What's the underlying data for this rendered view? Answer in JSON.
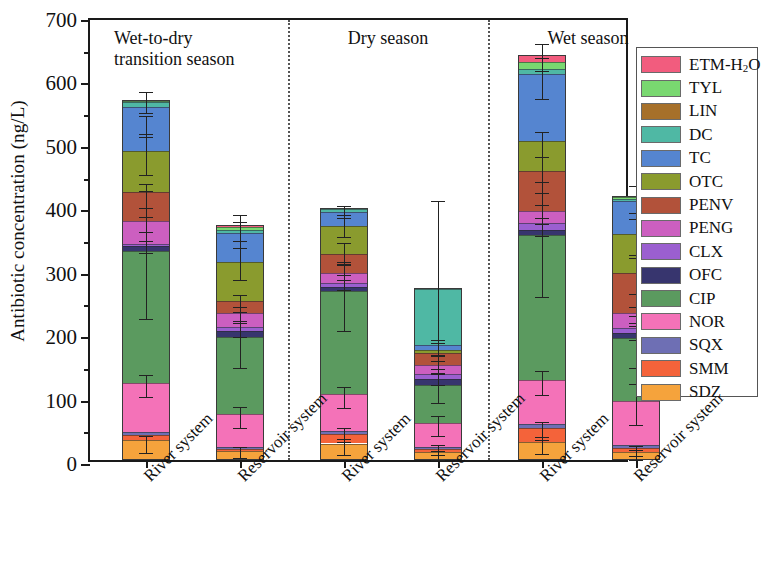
{
  "chart_data": {
    "type": "bar",
    "subtype": "stacked-bar-grouped",
    "title": "",
    "xlabel": "",
    "ylabel": "Antibiotic concentration (ng/L)",
    "ylim": [
      0,
      700
    ],
    "yticks": [
      0,
      100,
      200,
      300,
      400,
      500,
      600,
      700
    ],
    "ytick_labels": [
      "0",
      "100",
      "200",
      "300",
      "400",
      "500",
      "600",
      "700"
    ],
    "yminor_ticks": [
      50,
      150,
      250,
      350,
      450,
      550,
      650
    ],
    "grid": false,
    "legend_position": "right-outside",
    "error_bars": true,
    "groups": [
      {
        "label": "Wet-to-dry\ntransition season",
        "line1": "Wet-to-dry",
        "line2": "transition season"
      },
      {
        "label": "Dry season",
        "line1": "Dry season",
        "line2": ""
      },
      {
        "label": "Wet season",
        "line1": "Wet season",
        "line2": ""
      }
    ],
    "categories": [
      "River system",
      "Reservoir system",
      "River system",
      "Reservoir system",
      "River system",
      "Reservoir system"
    ],
    "series": [
      {
        "name": "SDZ",
        "color": "#F5A33C",
        "values": [
          31,
          14,
          26,
          12,
          28,
          13
        ]
      },
      {
        "name": "SMM",
        "color": "#F4633A",
        "values": [
          8,
          3,
          15,
          5,
          23,
          6
        ]
      },
      {
        "name": "SQX",
        "color": "#6E6FB4",
        "values": [
          5,
          4,
          4,
          4,
          6,
          4
        ]
      },
      {
        "name": "NOR",
        "color": "#F472B8",
        "values": [
          77,
          51,
          59,
          38,
          69,
          70
        ]
      },
      {
        "name": "CIP",
        "color": "#5B9A5F",
        "values": [
          209,
          122,
          163,
          60,
          228,
          99
        ]
      },
      {
        "name": "OFC",
        "color": "#37356E",
        "values": [
          7,
          9,
          6,
          8,
          9,
          8
        ]
      },
      {
        "name": "CLX",
        "color": "#9B5FD0",
        "values": [
          4,
          7,
          6,
          9,
          11,
          8
        ]
      },
      {
        "name": "PENG",
        "color": "#CC5FC0",
        "values": [
          36,
          22,
          16,
          13,
          18,
          24
        ]
      },
      {
        "name": "PENV",
        "color": "#B2523A",
        "values": [
          45,
          18,
          30,
          19,
          63,
          63
        ]
      },
      {
        "name": "OTC",
        "color": "#8A9B2E",
        "values": [
          65,
          62,
          44,
          6,
          48,
          62
        ]
      },
      {
        "name": "TC",
        "color": "#5585D0",
        "values": [
          69,
          46,
          22,
          8,
          106,
          51
        ]
      },
      {
        "name": "DC",
        "color": "#4FB8A4",
        "values": [
          8,
          5,
          5,
          88,
          8,
          4
        ]
      },
      {
        "name": "TYL",
        "color": "#79D870",
        "values": [
          2,
          4,
          0,
          0,
          10,
          2
        ]
      },
      {
        "name": "ETM-H2O",
        "color": "#F25C7E",
        "values": [
          1,
          3,
          1,
          1,
          11,
          2
        ]
      }
    ],
    "bar_totals": [
      567,
      370,
      397,
      271,
      638,
      416
    ]
  },
  "legend": {
    "entries": [
      {
        "label": "ETM-H",
        "sub": "2",
        "tail": "O",
        "color": "#F25C7E"
      },
      {
        "label": "TYL",
        "sub": "",
        "tail": "",
        "color": "#79D870"
      },
      {
        "label": "LIN",
        "sub": "",
        "tail": "",
        "color": "#A6702A"
      },
      {
        "label": "DC",
        "sub": "",
        "tail": "",
        "color": "#4FB8A4"
      },
      {
        "label": "TC",
        "sub": "",
        "tail": "",
        "color": "#5585D0"
      },
      {
        "label": "OTC",
        "sub": "",
        "tail": "",
        "color": "#8A9B2E"
      },
      {
        "label": "PENV",
        "sub": "",
        "tail": "",
        "color": "#B2523A"
      },
      {
        "label": "PENG",
        "sub": "",
        "tail": "",
        "color": "#CC5FC0"
      },
      {
        "label": "CLX",
        "sub": "",
        "tail": "",
        "color": "#9B5FD0"
      },
      {
        "label": "OFC",
        "sub": "",
        "tail": "",
        "color": "#37356E"
      },
      {
        "label": "CIP",
        "sub": "",
        "tail": "",
        "color": "#5B9A5F"
      },
      {
        "label": "NOR",
        "sub": "",
        "tail": "",
        "color": "#F472B8"
      },
      {
        "label": "SQX",
        "sub": "",
        "tail": "",
        "color": "#6E6FB4"
      },
      {
        "label": "SMM",
        "sub": "",
        "tail": "",
        "color": "#F4633A"
      },
      {
        "label": "SDZ",
        "sub": "",
        "tail": "",
        "color": "#F5A33C"
      }
    ]
  },
  "error_bars": [
    {
      "bar": 0,
      "points": [
        {
          "y": 31,
          "lo": 18,
          "hi": 44
        },
        {
          "y": 121,
          "lo": 105,
          "hi": 140
        },
        {
          "y": 330,
          "lo": 228,
          "hi": 430
        },
        {
          "y": 341,
          "lo": 332,
          "hi": 352
        },
        {
          "y": 377,
          "lo": 366,
          "hi": 389
        },
        {
          "y": 422,
          "lo": 404,
          "hi": 441
        },
        {
          "y": 487,
          "lo": 455,
          "hi": 520
        },
        {
          "y": 531,
          "lo": 516,
          "hi": 548
        },
        {
          "y": 567,
          "lo": 553,
          "hi": 586
        }
      ]
    },
    {
      "bar": 1,
      "points": [
        {
          "y": 17,
          "lo": 9,
          "hi": 27
        },
        {
          "y": 72,
          "lo": 56,
          "hi": 90
        },
        {
          "y": 194,
          "lo": 152,
          "hi": 240
        },
        {
          "y": 212,
          "lo": 200,
          "hi": 226
        },
        {
          "y": 234,
          "lo": 222,
          "hi": 247
        },
        {
          "y": 252,
          "lo": 240,
          "hi": 266
        },
        {
          "y": 314,
          "lo": 290,
          "hi": 340
        },
        {
          "y": 360,
          "lo": 340,
          "hi": 382
        },
        {
          "y": 370,
          "lo": 352,
          "hi": 392
        }
      ]
    },
    {
      "bar": 2,
      "points": [
        {
          "y": 26,
          "lo": 14,
          "hi": 40
        },
        {
          "y": 45,
          "lo": 34,
          "hi": 57
        },
        {
          "y": 104,
          "lo": 88,
          "hi": 122
        },
        {
          "y": 267,
          "lo": 210,
          "hi": 318
        },
        {
          "y": 285,
          "lo": 274,
          "hi": 298
        },
        {
          "y": 301,
          "lo": 290,
          "hi": 314
        },
        {
          "y": 331,
          "lo": 316,
          "hi": 348
        },
        {
          "y": 375,
          "lo": 358,
          "hi": 392
        },
        {
          "y": 397,
          "lo": 388,
          "hi": 406
        }
      ]
    },
    {
      "bar": 3,
      "points": [
        {
          "y": 12,
          "lo": 6,
          "hi": 20
        },
        {
          "y": 21,
          "lo": 14,
          "hi": 30
        },
        {
          "y": 59,
          "lo": 44,
          "hi": 76
        },
        {
          "y": 119,
          "lo": 96,
          "hi": 144
        },
        {
          "y": 136,
          "lo": 124,
          "hi": 150
        },
        {
          "y": 155,
          "lo": 142,
          "hi": 170
        },
        {
          "y": 175,
          "lo": 162,
          "hi": 190
        },
        {
          "y": 183,
          "lo": 172,
          "hi": 196
        },
        {
          "y": 271,
          "lo": 196,
          "hi": 414
        }
      ]
    },
    {
      "bar": 4,
      "points": [
        {
          "y": 28,
          "lo": 16,
          "hi": 42
        },
        {
          "y": 51,
          "lo": 38,
          "hi": 66
        },
        {
          "y": 126,
          "lo": 108,
          "hi": 146
        },
        {
          "y": 354,
          "lo": 264,
          "hi": 444
        },
        {
          "y": 374,
          "lo": 360,
          "hi": 388
        },
        {
          "y": 392,
          "lo": 378,
          "hi": 408
        },
        {
          "y": 455,
          "lo": 428,
          "hi": 484
        },
        {
          "y": 503,
          "lo": 484,
          "hi": 524
        },
        {
          "y": 609,
          "lo": 576,
          "hi": 640
        },
        {
          "y": 638,
          "lo": 620,
          "hi": 662
        }
      ]
    },
    {
      "bar": 5,
      "points": [
        {
          "y": 13,
          "lo": 6,
          "hi": 22
        },
        {
          "y": 19,
          "lo": 12,
          "hi": 28
        },
        {
          "y": 93,
          "lo": 62,
          "hi": 126
        },
        {
          "y": 192,
          "lo": 152,
          "hi": 234
        },
        {
          "y": 208,
          "lo": 196,
          "hi": 222
        },
        {
          "y": 232,
          "lo": 218,
          "hi": 248
        },
        {
          "y": 295,
          "lo": 268,
          "hi": 324
        },
        {
          "y": 357,
          "lo": 330,
          "hi": 386
        },
        {
          "y": 416,
          "lo": 396,
          "hi": 438
        }
      ]
    }
  ]
}
